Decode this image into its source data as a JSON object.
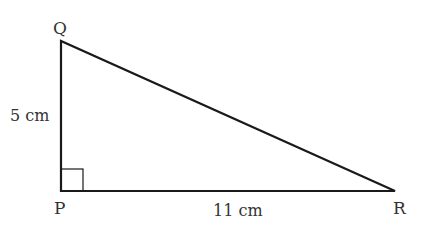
{
  "diagram": {
    "type": "right-triangle",
    "vertices": {
      "Q": {
        "label": "Q",
        "x": 61,
        "y": 41
      },
      "P": {
        "label": "P",
        "x": 61,
        "y": 191
      },
      "R": {
        "label": "R",
        "x": 395,
        "y": 191
      }
    },
    "sides": {
      "PQ": {
        "label": "5 cm"
      },
      "PR": {
        "label": "11 cm"
      }
    },
    "right_angle_at": "P",
    "colors": {
      "line": "#1a1a1a",
      "text": "#333333",
      "background": "#ffffff"
    }
  }
}
